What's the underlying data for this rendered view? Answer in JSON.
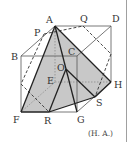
{
  "figure": {
    "type": "cube-with-pyramid",
    "credit": "(H. A.)",
    "colors": {
      "background": "#ffffff",
      "shade": "#c8c8c8",
      "cube_edge": "#555555",
      "pyramid_edge": "#222222",
      "dashed": "#333333",
      "divider": "#888888"
    },
    "points": {
      "A": {
        "label": "A",
        "x": 55,
        "y": 26
      },
      "B": {
        "label": "B",
        "x": 21,
        "y": 56
      },
      "C": {
        "label": "C",
        "x": 77,
        "y": 56
      },
      "D": {
        "label": "D",
        "x": 111,
        "y": 26
      },
      "E": {
        "label": "E",
        "x": 55,
        "y": 82
      },
      "F": {
        "label": "F",
        "x": 21,
        "y": 112
      },
      "G": {
        "label": "G",
        "x": 77,
        "y": 112
      },
      "H": {
        "label": "H",
        "x": 111,
        "y": 82
      },
      "O": {
        "label": "O",
        "x": 66,
        "y": 69
      },
      "P": {
        "label": "P",
        "x": 44,
        "y": 34
      },
      "Q": {
        "label": "Q",
        "x": 83,
        "y": 26
      },
      "R": {
        "label": "R",
        "x": 49,
        "y": 112
      },
      "S": {
        "label": "S",
        "x": 95,
        "y": 97
      }
    },
    "labels": [
      {
        "text": "A",
        "x": 46,
        "y": 23
      },
      {
        "text": "Q",
        "x": 80,
        "y": 22
      },
      {
        "text": "D",
        "x": 112,
        "y": 22
      },
      {
        "text": "P",
        "x": 34,
        "y": 36
      },
      {
        "text": "B",
        "x": 11,
        "y": 60
      },
      {
        "text": "C",
        "x": 68,
        "y": 55
      },
      {
        "text": "O",
        "x": 57,
        "y": 71
      },
      {
        "text": "E",
        "x": 47,
        "y": 84
      },
      {
        "text": "H",
        "x": 114,
        "y": 88
      },
      {
        "text": "S",
        "x": 96,
        "y": 106
      },
      {
        "text": "F",
        "x": 13,
        "y": 123
      },
      {
        "text": "R",
        "x": 44,
        "y": 124
      },
      {
        "text": "G",
        "x": 77,
        "y": 123
      }
    ]
  }
}
